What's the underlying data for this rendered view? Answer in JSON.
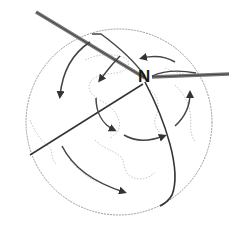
{
  "diagram": {
    "title": "",
    "pole_label": "N",
    "colors": {
      "globe_outline": "#9a9a9a",
      "coastline": "#b8b8b8",
      "axis": "#555555",
      "axis_highlight": "#8a8a8a",
      "meridian": "#333333",
      "arrow": "#333333"
    },
    "elements": [
      {
        "type": "globe",
        "label": "Earth"
      },
      {
        "type": "rotation-axis",
        "label": "tilted axis"
      },
      {
        "type": "pole",
        "label": "N"
      },
      {
        "type": "meridian",
        "label": "meridian line"
      },
      {
        "type": "equatorial-line",
        "label": "terminator line"
      },
      {
        "type": "circulation-arrows",
        "count": 8
      }
    ]
  }
}
